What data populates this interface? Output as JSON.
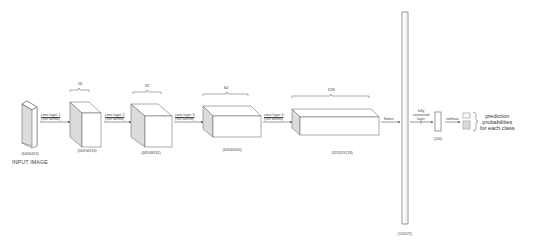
{
  "input": {
    "dims": "(64X64X3)",
    "title": "INPUT IMAGE"
  },
  "layers": [
    {
      "filters": "16",
      "dims": "(56X56X16)",
      "conv_label": "conv layer 1",
      "kernel_label": "(9x9 kernel)"
    },
    {
      "filters": "32",
      "dims": "(48X48X32)",
      "conv_label": "conv layer 2",
      "kernel_label": "(9x9 kernel)"
    },
    {
      "filters": "64",
      "dims": "(40X40X64)",
      "conv_label": "conv layer 3",
      "kernel_label": "(9x9 kernel)"
    },
    {
      "filters": "128",
      "dims": "(32X32X128)",
      "conv_label": "conv layer 4",
      "kernel_label": "(9x9 kernel)"
    }
  ],
  "flatten": {
    "label": "flatten",
    "dims": "(131072)"
  },
  "fully_connected": {
    "label_line1": "fully",
    "label_line2": "connected",
    "label_line3": "layer",
    "label_line4": "1",
    "dims": "(100)"
  },
  "softmax": {
    "label": "softmax"
  },
  "output": {
    "line1": "prediction",
    "line2": "probabilities",
    "line3": "for each class"
  },
  "colors": {
    "stroke": "#555555",
    "side_face": "#dcdcdc",
    "face": "#ffffff"
  }
}
